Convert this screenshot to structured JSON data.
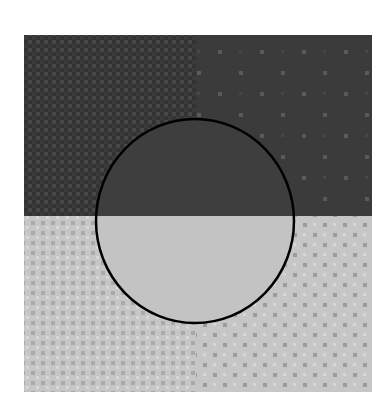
{
  "figure": {
    "canvas": {
      "width": 388,
      "height": 419,
      "background": "#ffffff"
    },
    "square": {
      "x": 24,
      "y": 35,
      "width": 348,
      "height": 357
    },
    "split": {
      "horizontal_y": 216,
      "vertical_x": 196
    },
    "colors": {
      "top_base": "#3b3b3b",
      "top_texture_dark": "#333333",
      "top_texture_light": "#474747",
      "top_right_dot": "#5a5a5a",
      "bottom_base": "#c6c6c6",
      "bottom_texture_dark": "#a9a9a9",
      "bottom_texture_light": "#d6d6d6",
      "bottom_right_dot": "#9c9c9c",
      "circle_top_fill": "#3e3e3e",
      "circle_bottom_fill": "#c3c3c3",
      "circle_stroke": "#000000"
    },
    "circle": {
      "cx": 195,
      "cy": 221,
      "rx": 99,
      "ry": 102,
      "stroke_width": 2.5
    },
    "quadrants": [
      {
        "name": "top-left",
        "pattern": "fine-checker-dark"
      },
      {
        "name": "top-right",
        "pattern": "sparse-light-dots"
      },
      {
        "name": "bottom-left",
        "pattern": "checker-light"
      },
      {
        "name": "bottom-right",
        "pattern": "staggered-dark-dots"
      }
    ]
  }
}
